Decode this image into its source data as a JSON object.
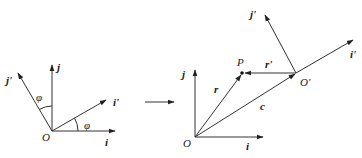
{
  "diagram": {
    "left_frame": {
      "origin_label": "O",
      "axes": {
        "i": "i",
        "j": "j",
        "i_prime": "i'",
        "j_prime": "j'"
      },
      "angle_labels": [
        "φ",
        "φ"
      ]
    },
    "transition_arrow": "right-arrow",
    "right_frame": {
      "origin_label": "O",
      "moving_origin_label": "O'",
      "point_label": "P",
      "axes": {
        "i": "i",
        "j": "j",
        "i_prime": "i'",
        "j_prime": "j'"
      },
      "vectors": {
        "r": "r",
        "r_prime": "r'",
        "c": "c"
      }
    }
  }
}
